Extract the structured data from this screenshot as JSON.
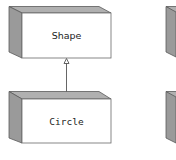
{
  "diagram": {
    "type": "uml-class-inheritance",
    "nodes": [
      {
        "id": "shape",
        "label": "Shape",
        "font": "sans"
      },
      {
        "id": "circle",
        "label": "Circle",
        "font": "mono"
      },
      {
        "id": "partial-top-right",
        "label": ""
      },
      {
        "id": "partial-bottom-right",
        "label": ""
      }
    ],
    "edges": [
      {
        "from": "circle",
        "to": "shape",
        "kind": "generalization",
        "arrow": "hollow-triangle"
      }
    ]
  },
  "colors": {
    "top_face": "#b0b0b0",
    "side_face": "#9a9a9a",
    "front_face": "#ffffff",
    "outline": "#5a5a5a"
  }
}
